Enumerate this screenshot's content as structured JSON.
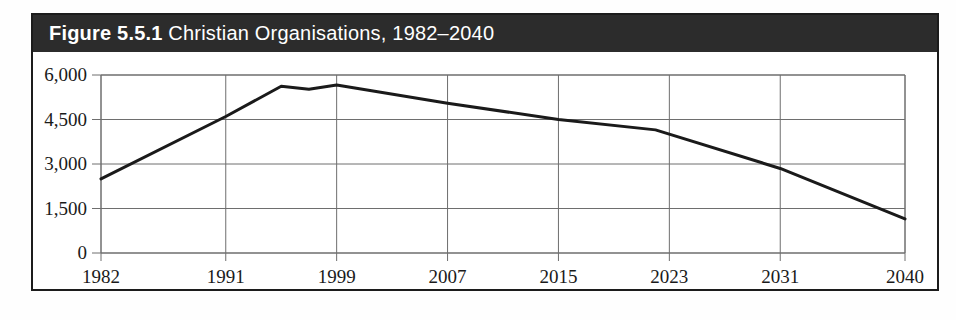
{
  "figure": {
    "number": "Figure 5.5.1",
    "label": "Christian Organisations, 1982–2040",
    "title_bar_color": "#2c2c2c",
    "title_text_color": "#ffffff",
    "frame_color": "#1c1c1c",
    "background_color": "#ffffff"
  },
  "chart_data": {
    "type": "line",
    "title": "Christian Organisations, 1982–2040",
    "xlabel": "",
    "ylabel": "",
    "x": [
      1982,
      1991,
      1999,
      2007,
      2015,
      2023,
      2031,
      2040
    ],
    "categories": [
      "1982",
      "1991",
      "1999",
      "2007",
      "2015",
      "2023",
      "2031",
      "2040"
    ],
    "xtick_labels": [
      "1982",
      "1991",
      "1999",
      "2007",
      "2015",
      "2023",
      "2031",
      "2040"
    ],
    "ytick_labels": [
      "0",
      "1,500",
      "3,000",
      "4,500",
      "6,000"
    ],
    "ytick_values": [
      0,
      1500,
      3000,
      4500,
      6000
    ],
    "ylim": [
      0,
      6000
    ],
    "xlim": [
      1982,
      2040
    ],
    "grid": true,
    "legend": false,
    "series": [
      {
        "name": "Christian Organisations",
        "color": "#1a1a1a",
        "line_width": 3,
        "points": [
          {
            "x": 1982,
            "y": 2500
          },
          {
            "x": 1991,
            "y": 4600
          },
          {
            "x": 1995,
            "y": 5620
          },
          {
            "x": 1997,
            "y": 5520
          },
          {
            "x": 1999,
            "y": 5660
          },
          {
            "x": 2007,
            "y": 5050
          },
          {
            "x": 2015,
            "y": 4500
          },
          {
            "x": 2022,
            "y": 4150
          },
          {
            "x": 2031,
            "y": 2850
          },
          {
            "x": 2040,
            "y": 1150
          }
        ]
      }
    ]
  }
}
